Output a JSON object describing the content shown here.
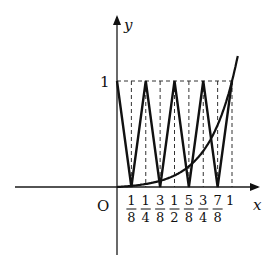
{
  "diagram": {
    "axes": {
      "x_label": "x",
      "y_label": "y",
      "origin_label": "O",
      "y_tick_label": "1",
      "x_max_label": "1"
    },
    "x_ticks": [
      {
        "value": 0.125,
        "num": "1",
        "den": "8"
      },
      {
        "value": 0.25,
        "num": "1",
        "den": "4"
      },
      {
        "value": 0.375,
        "num": "3",
        "den": "8"
      },
      {
        "value": 0.5,
        "num": "1",
        "den": "2"
      },
      {
        "value": 0.625,
        "num": "5",
        "den": "8"
      },
      {
        "value": 0.75,
        "num": "3",
        "den": "4"
      },
      {
        "value": 0.875,
        "num": "7",
        "den": "8"
      }
    ],
    "zigzag_points": [
      [
        0,
        1
      ],
      [
        0.125,
        0
      ],
      [
        0.25,
        1
      ],
      [
        0.375,
        0
      ],
      [
        0.5,
        1
      ],
      [
        0.625,
        0
      ],
      [
        0.75,
        1
      ],
      [
        0.875,
        0
      ],
      [
        1,
        1
      ]
    ],
    "dashed_verticals": [
      0.125,
      0.25,
      0.375,
      0.5,
      0.625,
      0.75,
      0.875,
      1
    ],
    "curve": {
      "description": "increasing convex curve through origin, crossing (1,1)",
      "x_range": [
        0,
        1.05
      ]
    }
  }
}
